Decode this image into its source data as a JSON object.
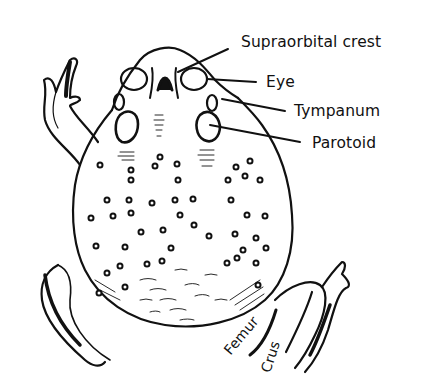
{
  "figure": {
    "colors": {
      "ink": "#111111",
      "paper": "#ffffff"
    },
    "labels": [
      {
        "id": "supraorbital-crest",
        "text": "Supraorbital crest"
      },
      {
        "id": "eye",
        "text": "Eye"
      },
      {
        "id": "tympanum",
        "text": "Tympanum"
      },
      {
        "id": "parotoid",
        "text": "Parotoid"
      },
      {
        "id": "femur",
        "text": "Femur"
      },
      {
        "id": "crus",
        "text": "Crus"
      }
    ]
  }
}
